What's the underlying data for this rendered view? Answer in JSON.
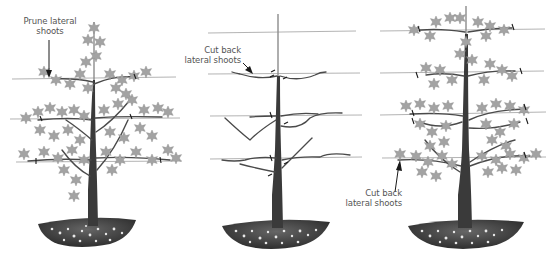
{
  "figure": {
    "type": "horticultural pruning diagram",
    "panels": [
      {
        "id": "panel-1",
        "stage": "leafy tree trained on wires",
        "wires": 3,
        "annotation": {
          "line1": "Prune lateral",
          "line2": "shoots",
          "arrow": "down"
        }
      },
      {
        "id": "panel-2",
        "stage": "bare framework after pruning",
        "wires": 4,
        "annotation": {
          "line1": "Cut back",
          "line2": "lateral shoots",
          "arrow": "right-down"
        }
      },
      {
        "id": "panel-3",
        "stage": "mature tree with four tiers",
        "wires": 4,
        "annotation": {
          "line1": "Cut back",
          "line2": "lateral shoots",
          "arrow": "up"
        }
      }
    ],
    "colors": {
      "background": "#ffffff",
      "wire": "#9a9a9a",
      "trunk": "#3a3a3a",
      "leaf": "#9b9b9b",
      "soil": "#4a4a4a",
      "text": "#555555"
    }
  }
}
